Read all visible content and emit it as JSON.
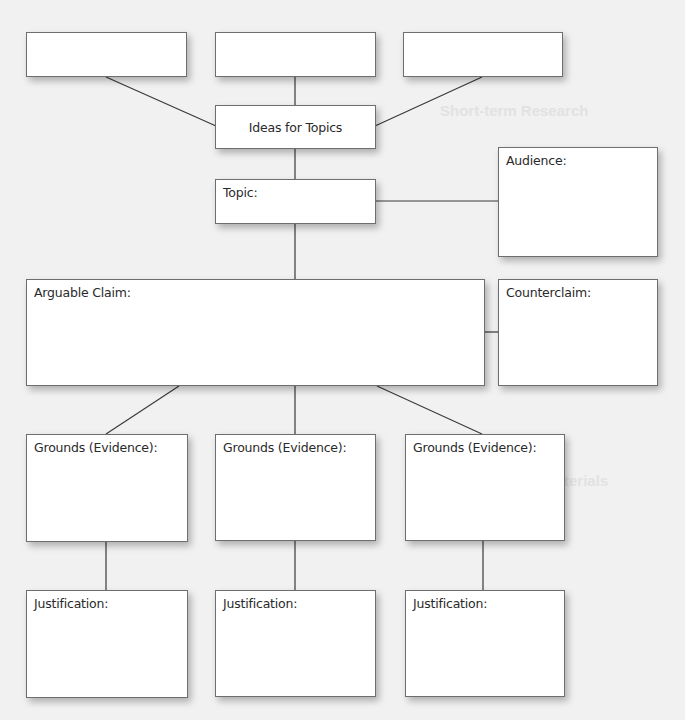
{
  "diagram": {
    "type": "argument-organizer",
    "boxes": {
      "idea1": {
        "label": ""
      },
      "idea2": {
        "label": ""
      },
      "idea3": {
        "label": ""
      },
      "ideas_for_topics": {
        "label": "Ideas for Topics"
      },
      "topic": {
        "label": "Topic:"
      },
      "audience": {
        "label": "Audience:"
      },
      "arguable_claim": {
        "label": "Arguable Claim:"
      },
      "counterclaim": {
        "label": "Counterclaim:"
      },
      "grounds": [
        {
          "label": "Grounds (Evidence):"
        },
        {
          "label": "Grounds (Evidence):"
        },
        {
          "label": "Grounds (Evidence):"
        }
      ],
      "justification": [
        {
          "label": "Justification:"
        },
        {
          "label": "Justification:"
        },
        {
          "label": "Justification:"
        }
      ]
    },
    "colors": {
      "background": "#f1f1f1",
      "box_fill": "#ffffff",
      "box_border": "#6e6e6e",
      "connector": "#3a3a3a",
      "text": "#2a2a2a"
    }
  },
  "background_ghost_text": {
    "heading1": "Short-term Research",
    "heading2": "Evaluating Internet Materials"
  }
}
